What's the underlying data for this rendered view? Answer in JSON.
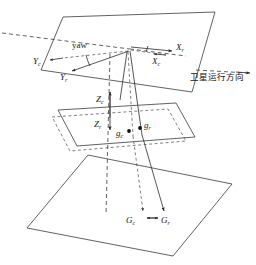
{
  "figure": {
    "title": "",
    "type": "3d-geometry-diagram"
  },
  "labels": {
    "yaw": "yaw",
    "direction_text": "卫星运行方向",
    "x_r": {
      "base": "X",
      "sub": "r"
    },
    "x_c": {
      "base": "X",
      "sub": "c"
    },
    "y_r": {
      "base": "Y",
      "sub": "r"
    },
    "y_c": {
      "base": "Y",
      "sub": "c"
    },
    "z_r": {
      "base": "Z",
      "sub": "r"
    },
    "z_c": {
      "base": "Z",
      "sub": "c"
    },
    "g_r": {
      "base": "g",
      "sub": "r"
    },
    "g_c": {
      "base": "g",
      "sub": "c"
    },
    "G_r": {
      "base": "G",
      "sub": "r"
    },
    "G_c": {
      "base": "G",
      "sub": "c"
    }
  },
  "colors": {
    "line": "#2b2b2b",
    "dashed": "#3a3a3a",
    "text": "#1a1a1a",
    "background": "#ffffff"
  },
  "planes": [
    {
      "name": "satellite-body-plane",
      "position": "top"
    },
    {
      "name": "image-plane",
      "position": "middle"
    },
    {
      "name": "ground-plane",
      "position": "bottom"
    }
  ],
  "points": [
    {
      "name": "g_c",
      "plane": "middle"
    },
    {
      "name": "g_r",
      "plane": "middle"
    },
    {
      "name": "G_c",
      "plane": "bottom"
    },
    {
      "name": "G_r",
      "plane": "bottom"
    }
  ]
}
